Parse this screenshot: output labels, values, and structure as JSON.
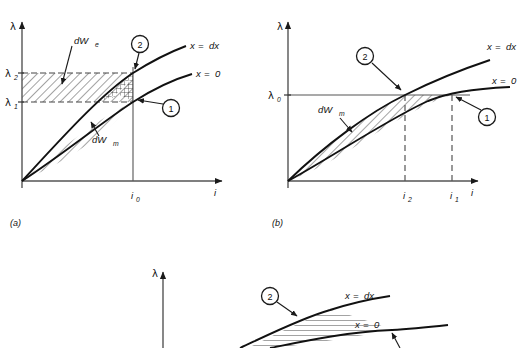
{
  "figure": {
    "title": "",
    "panels": [
      {
        "id": "a",
        "caption": "(a)",
        "axes": {
          "y_label": "λ",
          "x_label": "i"
        },
        "y_ticks": [
          {
            "label": "λ",
            "sub": "2"
          },
          {
            "label": "λ",
            "sub": "1"
          }
        ],
        "x_ticks": [
          {
            "label": "i",
            "sub": "0"
          }
        ],
        "curves": [
          {
            "label_prefix": "x",
            "label_eq": "=",
            "label_value": "dx",
            "name": "x = dx"
          },
          {
            "label_prefix": "x",
            "label_eq": "=",
            "label_value": "0",
            "name": "x = 0"
          }
        ],
        "regions": [
          {
            "label_main": "dW",
            "label_sub": "e",
            "hatch": "diagonal",
            "name": "electrical-energy-band"
          },
          {
            "label_main": "dW",
            "label_sub": "m",
            "hatch": "diagonal",
            "name": "magnetic-energy-band"
          }
        ],
        "markers": [
          {
            "label": "1"
          },
          {
            "label": "2"
          }
        ]
      },
      {
        "id": "b",
        "caption": "(b)",
        "axes": {
          "y_label": "λ",
          "x_label": "i"
        },
        "y_ticks": [
          {
            "label": "λ",
            "sub": "0"
          }
        ],
        "x_ticks": [
          {
            "label": "i",
            "sub": "2"
          },
          {
            "label": "i",
            "sub": "1"
          }
        ],
        "curves": [
          {
            "label_prefix": "x",
            "label_eq": "=",
            "label_value": "dx",
            "name": "x = dx"
          },
          {
            "label_prefix": "x",
            "label_eq": "=",
            "label_value": "0",
            "name": "x = 0"
          }
        ],
        "regions": [
          {
            "label_main": "dW",
            "label_sub": "m",
            "hatch": "diagonal",
            "name": "magnetic-energy-region"
          }
        ],
        "markers": [
          {
            "label": "1"
          },
          {
            "label": "2"
          }
        ]
      },
      {
        "id": "c",
        "caption": "",
        "axes": {
          "y_label": "λ",
          "x_label": ""
        },
        "y_ticks": [],
        "x_ticks": [],
        "curves": [
          {
            "label_prefix": "x",
            "label_eq": "=",
            "label_value": "dx",
            "name": "x = dx"
          },
          {
            "label_prefix": "x",
            "label_eq": "=",
            "label_value": "0",
            "name": "x = 0"
          }
        ],
        "regions": [],
        "markers": [
          {
            "label": "2"
          }
        ]
      }
    ]
  },
  "colors": {
    "ink": "#1a1a1a",
    "axis": "#555555",
    "curve": "#111111",
    "hatch": "#333333",
    "background": "#ffffff"
  }
}
